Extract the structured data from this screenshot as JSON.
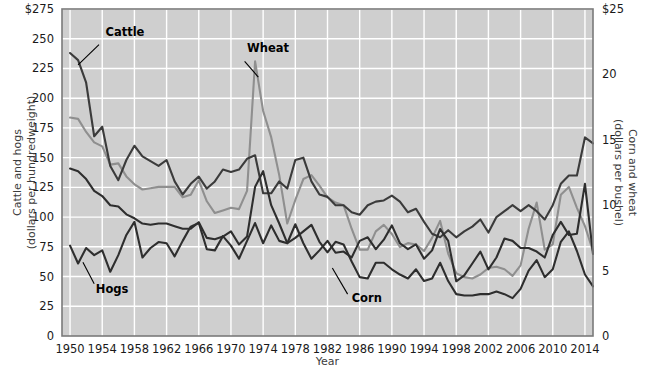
{
  "chart_data": {
    "type": "line",
    "title": "",
    "xlabel": "Year",
    "ylabel": "Cattle and hogs (dollars per hundredweight)",
    "y2label": "Corn and wheat (dollars per bushel)",
    "xlim": [
      1949,
      2015
    ],
    "ylim": [
      0,
      275
    ],
    "y2lim": [
      0,
      25
    ],
    "grid": true,
    "legend_position": "inline-annotations",
    "x_ticks": [
      1950,
      1954,
      1958,
      1962,
      1966,
      1970,
      1974,
      1978,
      1982,
      1986,
      1990,
      1994,
      1998,
      2002,
      2006,
      2010,
      2014
    ],
    "x_tick_labels": [
      "1950",
      "1954",
      "1958",
      "1962",
      "1966",
      "1970",
      "1974",
      "1978",
      "1982",
      "1986",
      "1990",
      "1994",
      "1998",
      "2002",
      "2006",
      "2010",
      "2014"
    ],
    "y_ticks": [
      0,
      25,
      50,
      75,
      100,
      125,
      150,
      175,
      200,
      225,
      250,
      275
    ],
    "y_tick_labels": [
      "0",
      "25",
      "50",
      "75",
      "100",
      "125",
      "150",
      "175",
      "200",
      "225",
      "250",
      "$275"
    ],
    "y2_ticks": [
      0,
      5,
      10,
      15,
      20,
      25
    ],
    "y2_tick_labels": [
      "0",
      "5",
      "10",
      "15",
      "20",
      "$25"
    ],
    "x": [
      1950,
      1951,
      1952,
      1953,
      1954,
      1955,
      1956,
      1957,
      1958,
      1959,
      1960,
      1961,
      1962,
      1963,
      1964,
      1965,
      1966,
      1967,
      1968,
      1969,
      1970,
      1971,
      1972,
      1973,
      1974,
      1975,
      1976,
      1977,
      1978,
      1979,
      1980,
      1981,
      1982,
      1983,
      1984,
      1985,
      1986,
      1987,
      1988,
      1989,
      1990,
      1991,
      1992,
      1993,
      1994,
      1995,
      1996,
      1997,
      1998,
      1999,
      2000,
      2001,
      2002,
      2003,
      2004,
      2005,
      2006,
      2007,
      2008,
      2009,
      2010,
      2011,
      2012,
      2013,
      2014,
      2015
    ],
    "series": [
      {
        "name": "Cattle",
        "axis": "left",
        "units": "dollars per hundredweight",
        "color": "#3b3b3b",
        "label_position": {
          "x": 1954.4,
          "y": 252
        },
        "leader_from": {
          "x": 1953.6,
          "y": 245
        },
        "leader_to": {
          "x": 1951.0,
          "y": 228
        },
        "values": [
          238,
          232,
          213,
          168,
          176,
          143,
          131,
          148,
          160,
          151,
          147,
          143,
          148,
          130,
          119,
          128,
          134,
          124,
          130,
          140,
          138,
          140,
          149,
          152,
          120,
          120,
          130,
          124,
          148,
          150,
          130,
          119,
          117,
          110,
          110,
          104,
          102,
          110,
          113,
          114,
          118,
          113,
          104,
          107,
          96,
          86,
          83,
          89,
          83,
          88,
          92,
          98,
          87,
          100,
          105,
          110,
          105,
          110,
          105,
          98,
          110,
          128,
          135,
          135,
          167,
          162
        ]
      },
      {
        "name": "Hogs",
        "axis": "left",
        "units": "dollars per hundredweight",
        "color": "#2e2e2e",
        "label_position": {
          "x": 1953.2,
          "y": 36
        },
        "leader_from": {
          "x": 1953.0,
          "y": 44
        },
        "leader_to": {
          "x": 1951.6,
          "y": 62
        },
        "values": [
          76,
          61,
          74,
          68,
          72,
          54,
          68,
          85,
          96,
          66,
          74,
          79,
          78,
          67,
          80,
          92,
          95,
          73,
          72,
          84,
          76,
          65,
          80,
          95,
          78,
          93,
          80,
          78,
          94,
          78,
          65,
          72,
          80,
          70,
          71,
          66,
          80,
          83,
          73,
          81,
          93,
          78,
          73,
          77,
          65,
          72,
          90,
          80,
          46,
          51,
          61,
          71,
          56,
          66,
          82,
          80,
          74,
          74,
          71,
          66,
          85,
          96,
          85,
          86,
          128,
          69
        ]
      },
      {
        "name": "Wheat",
        "axis": "right",
        "units": "dollars per bushel",
        "color": "#8f8f8f",
        "label_position": {
          "x": 1972.0,
          "y": 21.7
        },
        "leader_from": {
          "x": 1971.7,
          "y": 21.0
        },
        "leader_to": {
          "x": 1973.4,
          "y": 19.8
        },
        "values": [
          16.7,
          16.6,
          15.6,
          14.8,
          14.5,
          13.1,
          13.2,
          12.2,
          11.6,
          11.2,
          11.3,
          11.4,
          11.4,
          11.4,
          10.6,
          10.8,
          11.9,
          10.3,
          9.4,
          9.6,
          9.8,
          9.7,
          11.1,
          21.0,
          17.2,
          15.2,
          12.3,
          8.6,
          10.4,
          12.0,
          12.3,
          11.5,
          10.6,
          10.2,
          10.0,
          8.2,
          6.6,
          6.6,
          8.0,
          8.5,
          7.8,
          6.8,
          7.1,
          7.0,
          6.5,
          7.5,
          8.8,
          6.3,
          4.8,
          4.5,
          4.4,
          4.7,
          5.2,
          5.3,
          5.1,
          4.6,
          5.4,
          8.2,
          10.2,
          6.6,
          7.0,
          10.8,
          11.4,
          9.8,
          8.4,
          6.5
        ]
      },
      {
        "name": "Corn",
        "axis": "right",
        "units": "dollars per bushel",
        "color": "#2e2e2e",
        "label_position": {
          "x": 1985.0,
          "y": 2.6
        },
        "leader_from": {
          "x": 1984.5,
          "y": 3.2
        },
        "leader_to": {
          "x": 1982.6,
          "y": 5.2
        },
        "values": [
          12.8,
          12.6,
          12.0,
          11.1,
          10.7,
          10.0,
          9.9,
          9.3,
          9.0,
          8.6,
          8.5,
          8.6,
          8.6,
          8.4,
          8.2,
          8.2,
          8.7,
          7.5,
          7.4,
          7.6,
          8.0,
          7.0,
          7.6,
          11.4,
          12.6,
          10.0,
          8.6,
          7.1,
          7.5,
          8.0,
          8.5,
          7.2,
          6.4,
          7.2,
          7.0,
          5.7,
          4.5,
          4.4,
          5.6,
          5.6,
          5.1,
          4.7,
          4.4,
          5.1,
          4.2,
          4.4,
          5.6,
          4.2,
          3.2,
          3.1,
          3.1,
          3.2,
          3.2,
          3.4,
          3.2,
          2.9,
          3.6,
          5.0,
          5.8,
          4.5,
          5.1,
          7.2,
          8.0,
          6.5,
          4.7,
          3.8
        ]
      }
    ]
  }
}
